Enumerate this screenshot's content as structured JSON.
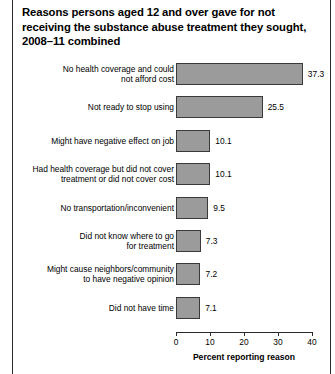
{
  "figure": {
    "title": "Reasons persons aged 12 and over gave for not receiving the substance abuse treatment they sought, 2008–11 combined",
    "axis_title": "Percent reporting reason",
    "bar_color": "#9b9b9b",
    "bar_border_color": "#3a3a3a",
    "axis_color": "#2b2b2b"
  },
  "chart_data": {
    "type": "bar",
    "orientation": "horizontal",
    "title": "Reasons persons aged 12 and over gave for not receiving the substance abuse treatment they sought, 2008–11 combined",
    "xlabel": "Percent reporting reason",
    "ylabel": "",
    "xlim": [
      0,
      40
    ],
    "xticks": [
      0,
      10,
      20,
      30,
      40
    ],
    "xtick_labels": [
      "0",
      "10",
      "20",
      "30",
      "40"
    ],
    "grid": false,
    "legend": false,
    "categories": [
      "No health coverage and could\nnot afford cost",
      "Not ready to stop using",
      "Might have negative effect on job",
      "Had health coverage but did not cover\ntreatment or did not cover cost",
      "No transportation/inconvenient",
      "Did not know where to go\nfor treatment",
      "Might cause neighbors/community\nto have negative opinion",
      "Did not have time"
    ],
    "values": [
      37.3,
      25.5,
      10.1,
      10.1,
      9.5,
      7.3,
      7.2,
      7.1
    ],
    "value_labels": [
      "37.3",
      "25.5",
      "10.1",
      "10.1",
      "9.5",
      "7.3",
      "7.2",
      "7.1"
    ]
  }
}
